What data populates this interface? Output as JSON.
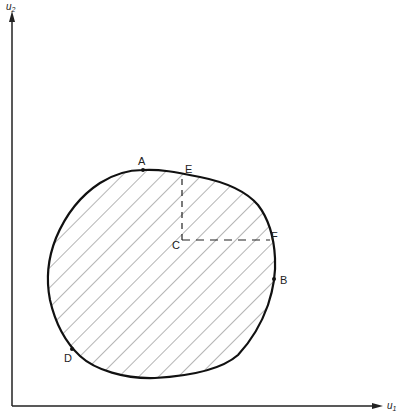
{
  "diagram": {
    "axes": {
      "x_label": "u₁",
      "y_label": "u₂",
      "x_label_base": "u",
      "x_label_sub": "1",
      "y_label_base": "u",
      "y_label_sub": "2"
    },
    "region": {
      "fill": "diagonal-hatching",
      "outline_color": "#111111",
      "hatch_color": "#777777"
    },
    "points": [
      {
        "label": "A",
        "marker": true
      },
      {
        "label": "E",
        "marker": false
      },
      {
        "label": "C",
        "marker": false
      },
      {
        "label": "F",
        "marker": false
      },
      {
        "label": "B",
        "marker": true
      },
      {
        "label": "D",
        "marker": true
      }
    ],
    "dashed_lines": [
      {
        "from": "C",
        "to": "E",
        "direction": "vertical"
      },
      {
        "from": "C",
        "to": "F",
        "direction": "horizontal"
      }
    ]
  }
}
